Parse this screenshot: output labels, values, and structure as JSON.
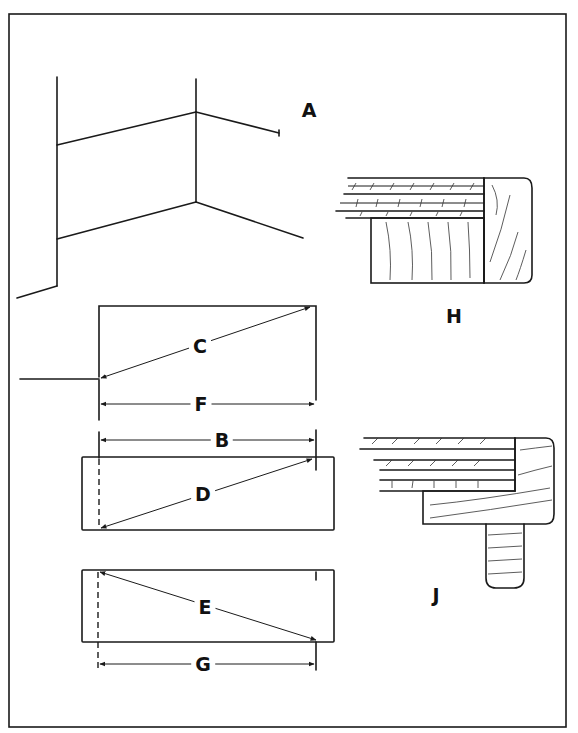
{
  "figure": {
    "labels": {
      "A": "A",
      "B": "B",
      "C": "C",
      "D": "D",
      "E": "E",
      "F": "F",
      "G": "G",
      "H": "H",
      "J": "J"
    },
    "colors": {
      "line": "#1a1a1a",
      "background": "#ffffff"
    }
  }
}
